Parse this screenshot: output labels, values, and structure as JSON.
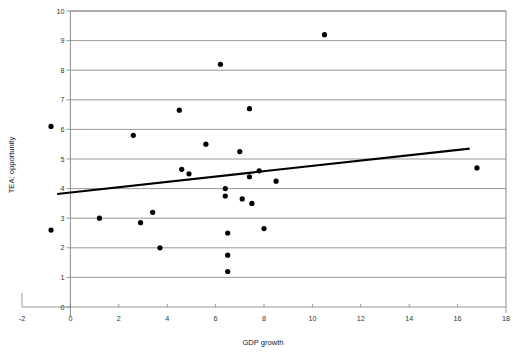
{
  "chart_data": {
    "type": "scatter",
    "title": "",
    "subtitle": "",
    "xlabel": "GDP growth",
    "ylabel": "TEA: opportunity",
    "xlim": [
      -2,
      18
    ],
    "ylim": [
      0,
      10
    ],
    "xticks": [
      -2,
      0,
      2,
      4,
      6,
      8,
      10,
      12,
      14,
      16,
      18
    ],
    "xtick_labels": [
      "-2",
      "0",
      "2",
      "4",
      "6",
      "8",
      "10",
      "12",
      "14",
      "16",
      "18"
    ],
    "yticks": [
      0,
      1,
      2,
      3,
      4,
      5,
      6,
      7,
      8,
      9,
      10
    ],
    "ytick_labels": [
      "0",
      "1",
      "2",
      "3",
      "4",
      "5",
      "6",
      "7",
      "8",
      "9",
      "10"
    ],
    "grid": {
      "horizontal": true,
      "vertical": false,
      "color": "#808080"
    },
    "legend": {
      "visible": false,
      "position": "none",
      "entries": []
    },
    "marker": {
      "shape": "circle",
      "color": "#000000",
      "size_px": 2.6
    },
    "series": [
      {
        "name": "countries",
        "type": "scatter",
        "color": "#000000",
        "points": [
          {
            "x": -0.8,
            "y": 6.1
          },
          {
            "x": -0.8,
            "y": 2.6
          },
          {
            "x": 1.2,
            "y": 3.0
          },
          {
            "x": 2.6,
            "y": 5.8
          },
          {
            "x": 2.9,
            "y": 2.85
          },
          {
            "x": 3.4,
            "y": 3.2
          },
          {
            "x": 3.7,
            "y": 2.0
          },
          {
            "x": 4.5,
            "y": 6.65
          },
          {
            "x": 4.6,
            "y": 4.65
          },
          {
            "x": 4.9,
            "y": 4.5
          },
          {
            "x": 5.6,
            "y": 5.5
          },
          {
            "x": 6.2,
            "y": 8.2
          },
          {
            "x": 6.4,
            "y": 4.0
          },
          {
            "x": 6.4,
            "y": 3.75
          },
          {
            "x": 6.5,
            "y": 2.5
          },
          {
            "x": 6.5,
            "y": 1.75
          },
          {
            "x": 6.5,
            "y": 1.2
          },
          {
            "x": 7.0,
            "y": 5.25
          },
          {
            "x": 7.1,
            "y": 3.65
          },
          {
            "x": 7.4,
            "y": 6.7
          },
          {
            "x": 7.4,
            "y": 4.4
          },
          {
            "x": 7.5,
            "y": 3.5
          },
          {
            "x": 7.8,
            "y": 4.6
          },
          {
            "x": 8.0,
            "y": 2.65
          },
          {
            "x": 8.5,
            "y": 4.25
          },
          {
            "x": 10.5,
            "y": 9.2
          },
          {
            "x": 16.8,
            "y": 4.7
          }
        ]
      },
      {
        "name": "linear trend",
        "type": "line",
        "color": "#000000",
        "points": [
          {
            "x": -0.55,
            "y": 3.82
          },
          {
            "x": 16.5,
            "y": 5.35
          }
        ]
      }
    ]
  }
}
